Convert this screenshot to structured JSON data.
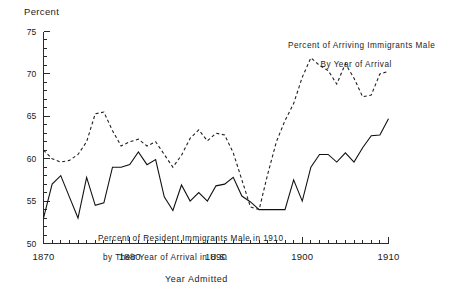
{
  "chart_data": {
    "type": "line",
    "title": "",
    "xlabel": "Year Admitted",
    "ylabel": "Percent",
    "xlim": [
      1870,
      1910
    ],
    "ylim": [
      50,
      75
    ],
    "grid": false,
    "legend_position": "inline-annotations",
    "y_ticks_major": [
      50,
      55,
      60,
      65,
      70,
      75
    ],
    "y_tick_labels": [
      "50",
      "55",
      "60",
      "65",
      "70",
      "75"
    ],
    "y_minor_tick_step": 1,
    "x_ticks_major": [
      1870,
      1880,
      1890,
      1900,
      1910
    ],
    "x_tick_labels": [
      "1870",
      "1880",
      "1890",
      "1900",
      "1910"
    ],
    "x_minor_tick_step": 1,
    "annotations": [
      {
        "name": "arriving-series-annotation",
        "line1": "Percent of Arriving Immigrants Male",
        "line2": "By Year of Arrival"
      },
      {
        "name": "resident-series-annotation",
        "line1": "Percent of Resident Immigrants Male in 1910",
        "line2": "by Their Year of Arrival in U.S."
      }
    ],
    "series": [
      {
        "name": "Percent of Resident Immigrants Male in 1910 by Their Year of Arrival in U.S.",
        "style": "solid",
        "color": "#111111",
        "x": [
          1870,
          1871,
          1872,
          1873,
          1874,
          1875,
          1876,
          1877,
          1878,
          1879,
          1880,
          1881,
          1882,
          1883,
          1884,
          1885,
          1886,
          1887,
          1888,
          1889,
          1890,
          1891,
          1892,
          1893,
          1894,
          1895,
          1896,
          1897,
          1898,
          1899,
          1900,
          1901,
          1902,
          1903,
          1904,
          1905,
          1906,
          1907,
          1908,
          1909,
          1910
        ],
        "values": [
          53.0,
          57.0,
          58.0,
          55.5,
          53.0,
          57.8,
          54.5,
          54.8,
          59.0,
          59.0,
          59.3,
          60.8,
          59.3,
          59.9,
          55.5,
          53.9,
          56.9,
          55.0,
          56.0,
          55.0,
          56.8,
          57.0,
          57.8,
          55.6,
          54.9,
          54.0,
          54.0,
          54.0,
          54.0,
          57.5,
          55.0,
          59.0,
          60.5,
          60.5,
          59.6,
          60.7,
          59.6,
          61.3,
          62.7,
          62.8,
          64.7
        ]
      },
      {
        "name": "Percent of Arriving Immigrants Male By Year of Arrival",
        "style": "dashed",
        "color": "#1f1f1f",
        "x": [
          1870,
          1871,
          1872,
          1873,
          1874,
          1875,
          1876,
          1877,
          1878,
          1879,
          1880,
          1881,
          1882,
          1883,
          1884,
          1885,
          1886,
          1887,
          1888,
          1889,
          1890,
          1891,
          1892,
          1893,
          1894,
          1895,
          1896,
          1897,
          1898,
          1899,
          1900,
          1901,
          1902,
          1903,
          1904,
          1905,
          1906,
          1907,
          1908,
          1909,
          1910
        ],
        "values": [
          61.0,
          60.0,
          59.6,
          59.8,
          60.5,
          62.0,
          65.3,
          65.5,
          63.3,
          61.5,
          62.0,
          62.3,
          61.5,
          62.0,
          60.5,
          59.0,
          60.4,
          62.4,
          63.4,
          62.1,
          63.0,
          62.8,
          60.7,
          57.5,
          54.3,
          54.0,
          58.2,
          62.0,
          64.5,
          66.5,
          69.6,
          71.9,
          71.0,
          70.4,
          68.8,
          71.2,
          69.5,
          67.3,
          67.5,
          70.0,
          70.3
        ]
      }
    ]
  },
  "labels": {
    "ylabel": "Percent",
    "xlabel": "Year Admitted"
  }
}
